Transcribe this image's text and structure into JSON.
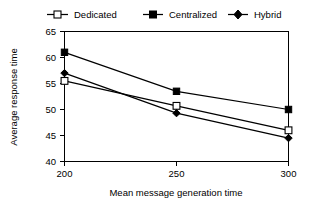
{
  "chart_data": {
    "type": "line",
    "title": "",
    "xlabel": "Mean message generation time",
    "ylabel": "Average response time",
    "x": [
      200,
      250,
      300
    ],
    "xticks": [
      "200",
      "250",
      "300"
    ],
    "yticks": [
      "40",
      "45",
      "50",
      "55",
      "60",
      "65"
    ],
    "xlim": [
      200,
      300
    ],
    "ylim": [
      40,
      65
    ],
    "grid": false,
    "legend_position": "top",
    "series": [
      {
        "name": "Dedicated",
        "marker": "open-square",
        "values": [
          55.5,
          50.7,
          46.0
        ]
      },
      {
        "name": "Centralized",
        "marker": "filled-square",
        "values": [
          61.0,
          53.5,
          50.0
        ]
      },
      {
        "name": "Hybrid",
        "marker": "filled-diamond",
        "values": [
          57.0,
          49.3,
          44.5
        ]
      }
    ]
  },
  "legend": {
    "items": [
      {
        "label": "Dedicated"
      },
      {
        "label": "Centralized"
      },
      {
        "label": "Hybrid"
      }
    ]
  },
  "axes": {
    "x_title": "Mean message generation time",
    "y_title": "Average response time",
    "x_tick_labels": [
      "200",
      "250",
      "300"
    ],
    "y_tick_labels": [
      "40",
      "45",
      "50",
      "55",
      "60",
      "65"
    ]
  },
  "colors": {
    "ink": "#000000",
    "background": "#ffffff"
  }
}
